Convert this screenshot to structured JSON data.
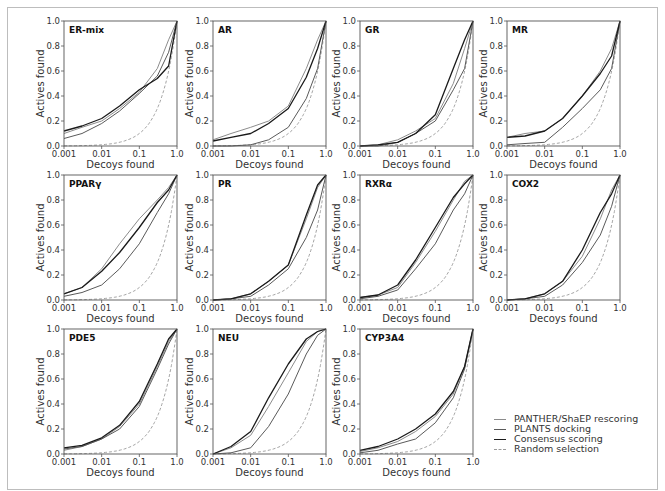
{
  "chart_data": {
    "type": "line",
    "layout": "small-multiples 3x4 grid (11 panels)",
    "xscale": "log",
    "xlabel": "Decoys found",
    "ylabel": "Actives found",
    "xticks": [
      "0.001",
      "0.01",
      "0.1",
      "1.0"
    ],
    "yticks": [
      "0.0",
      "0.2",
      "0.4",
      "0.6",
      "0.8",
      "1.0"
    ],
    "xlim": [
      0.001,
      1.0
    ],
    "ylim": [
      0.0,
      1.0
    ],
    "grid": false,
    "legend_position": "bottom-right",
    "legend": [
      {
        "name": "PANTHER/ShaEP rescoring",
        "color": "#8c8c8c",
        "style": "solid"
      },
      {
        "name": "PLANTS docking",
        "color": "#5a5a5a",
        "style": "solid"
      },
      {
        "name": "Consensus scoring",
        "color": "#1a1a1a",
        "style": "solid"
      },
      {
        "name": "Random selection",
        "color": "#9a9a9a",
        "style": "dashed"
      }
    ],
    "x": [
      0.001,
      0.003,
      0.01,
      0.03,
      0.1,
      0.3,
      0.6,
      1.0
    ],
    "panels": [
      {
        "title": "ER-mix",
        "series": [
          {
            "name": "PANTHER/ShaEP rescoring",
            "values": [
              0.1,
              0.15,
              0.2,
              0.3,
              0.43,
              0.62,
              0.85,
              1.0
            ]
          },
          {
            "name": "PLANTS docking",
            "values": [
              0.06,
              0.1,
              0.18,
              0.28,
              0.42,
              0.56,
              0.75,
              1.0
            ]
          },
          {
            "name": "Consensus scoring",
            "values": [
              0.12,
              0.16,
              0.22,
              0.32,
              0.45,
              0.54,
              0.64,
              1.0
            ]
          }
        ]
      },
      {
        "title": "AR",
        "series": [
          {
            "name": "PANTHER/ShaEP rescoring",
            "values": [
              0.05,
              0.1,
              0.15,
              0.2,
              0.32,
              0.62,
              0.85,
              1.0
            ]
          },
          {
            "name": "PLANTS docking",
            "values": [
              0.0,
              0.0,
              0.01,
              0.05,
              0.15,
              0.38,
              0.62,
              1.0
            ]
          },
          {
            "name": "Consensus scoring",
            "values": [
              0.04,
              0.07,
              0.1,
              0.18,
              0.3,
              0.55,
              0.78,
              1.0
            ]
          }
        ]
      },
      {
        "title": "GR",
        "series": [
          {
            "name": "PANTHER/ShaEP rescoring",
            "values": [
              0.0,
              0.01,
              0.05,
              0.12,
              0.22,
              0.5,
              0.78,
              1.0
            ]
          },
          {
            "name": "PLANTS docking",
            "values": [
              0.0,
              0.0,
              0.03,
              0.1,
              0.2,
              0.45,
              0.62,
              1.0
            ]
          },
          {
            "name": "Consensus scoring",
            "values": [
              0.0,
              0.01,
              0.03,
              0.1,
              0.25,
              0.62,
              0.85,
              1.0
            ]
          }
        ]
      },
      {
        "title": "MR",
        "series": [
          {
            "name": "PANTHER/ShaEP rescoring",
            "values": [
              0.07,
              0.1,
              0.12,
              0.22,
              0.4,
              0.6,
              0.78,
              1.0
            ]
          },
          {
            "name": "PLANTS docking",
            "values": [
              0.01,
              0.02,
              0.03,
              0.15,
              0.3,
              0.45,
              0.62,
              1.0
            ]
          },
          {
            "name": "Consensus scoring",
            "values": [
              0.07,
              0.08,
              0.12,
              0.22,
              0.4,
              0.58,
              0.72,
              1.0
            ]
          }
        ]
      },
      {
        "title": "PPARγ",
        "series": [
          {
            "name": "PANTHER/ShaEP rescoring",
            "values": [
              0.05,
              0.1,
              0.25,
              0.45,
              0.65,
              0.8,
              0.9,
              1.0
            ]
          },
          {
            "name": "PLANTS docking",
            "values": [
              0.03,
              0.06,
              0.12,
              0.25,
              0.45,
              0.7,
              0.85,
              1.0
            ]
          },
          {
            "name": "Consensus scoring",
            "values": [
              0.05,
              0.1,
              0.23,
              0.38,
              0.58,
              0.78,
              0.88,
              1.0
            ]
          }
        ]
      },
      {
        "title": "PR",
        "series": [
          {
            "name": "PANTHER/ShaEP rescoring",
            "values": [
              0.0,
              0.01,
              0.05,
              0.15,
              0.28,
              0.65,
              0.9,
              1.0
            ]
          },
          {
            "name": "PLANTS docking",
            "values": [
              0.0,
              0.01,
              0.03,
              0.12,
              0.25,
              0.5,
              0.72,
              1.0
            ]
          },
          {
            "name": "Consensus scoring",
            "values": [
              0.0,
              0.01,
              0.05,
              0.15,
              0.28,
              0.68,
              0.92,
              1.0
            ]
          }
        ]
      },
      {
        "title": "RXRα",
        "series": [
          {
            "name": "PANTHER/ShaEP rescoring",
            "values": [
              0.02,
              0.04,
              0.1,
              0.3,
              0.55,
              0.8,
              0.95,
              1.0
            ]
          },
          {
            "name": "PLANTS docking",
            "values": [
              0.01,
              0.03,
              0.08,
              0.25,
              0.45,
              0.72,
              0.85,
              1.0
            ]
          },
          {
            "name": "Consensus scoring",
            "values": [
              0.02,
              0.04,
              0.12,
              0.32,
              0.58,
              0.82,
              0.93,
              1.0
            ]
          }
        ]
      },
      {
        "title": "COX2",
        "series": [
          {
            "name": "PANTHER/ShaEP rescoring",
            "values": [
              0.0,
              0.01,
              0.05,
              0.15,
              0.35,
              0.65,
              0.88,
              1.0
            ]
          },
          {
            "name": "PLANTS docking",
            "values": [
              0.0,
              0.01,
              0.03,
              0.12,
              0.3,
              0.52,
              0.75,
              1.0
            ]
          },
          {
            "name": "Consensus scoring",
            "values": [
              0.0,
              0.01,
              0.05,
              0.15,
              0.4,
              0.7,
              0.85,
              1.0
            ]
          }
        ]
      },
      {
        "title": "PDE5",
        "series": [
          {
            "name": "PANTHER/ShaEP rescoring",
            "values": [
              0.03,
              0.06,
              0.12,
              0.22,
              0.4,
              0.7,
              0.9,
              1.0
            ]
          },
          {
            "name": "PLANTS docking",
            "values": [
              0.04,
              0.06,
              0.12,
              0.2,
              0.38,
              0.68,
              0.88,
              1.0
            ]
          },
          {
            "name": "Consensus scoring",
            "values": [
              0.05,
              0.07,
              0.13,
              0.23,
              0.42,
              0.72,
              0.92,
              1.0
            ]
          }
        ]
      },
      {
        "title": "NEU",
        "series": [
          {
            "name": "PANTHER/ShaEP rescoring",
            "values": [
              0.0,
              0.05,
              0.15,
              0.38,
              0.65,
              0.9,
              0.98,
              1.0
            ]
          },
          {
            "name": "PLANTS docking",
            "values": [
              0.0,
              0.01,
              0.05,
              0.22,
              0.48,
              0.8,
              0.95,
              1.0
            ]
          },
          {
            "name": "Consensus scoring",
            "values": [
              0.0,
              0.06,
              0.18,
              0.45,
              0.72,
              0.92,
              0.98,
              1.0
            ]
          }
        ]
      },
      {
        "title": "CYP3A4",
        "series": [
          {
            "name": "PANTHER/ShaEP rescoring",
            "values": [
              0.02,
              0.05,
              0.1,
              0.18,
              0.3,
              0.48,
              0.7,
              1.0
            ]
          },
          {
            "name": "PLANTS docking",
            "values": [
              0.01,
              0.03,
              0.08,
              0.12,
              0.25,
              0.45,
              0.68,
              1.0
            ]
          },
          {
            "name": "Consensus scoring",
            "values": [
              0.03,
              0.06,
              0.12,
              0.2,
              0.32,
              0.5,
              0.7,
              1.0
            ]
          }
        ]
      }
    ]
  },
  "legend": {
    "items": [
      {
        "label": "PANTHER/ShaEP rescoring"
      },
      {
        "label": "PLANTS docking"
      },
      {
        "label": "Consensus scoring"
      },
      {
        "label": "Random selection"
      }
    ]
  }
}
